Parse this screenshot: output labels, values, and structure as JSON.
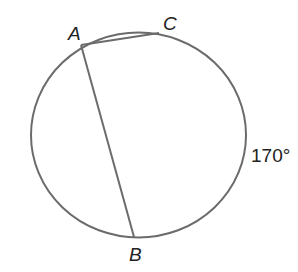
{
  "diagram": {
    "type": "circle-with-chords",
    "points": {
      "A": {
        "label": "A",
        "x": 81,
        "y": 45
      },
      "B": {
        "label": "B",
        "x": 134,
        "y": 240
      },
      "C": {
        "label": "C",
        "x": 159,
        "y": 33
      }
    },
    "chords": [
      {
        "from": "A",
        "to": "C"
      },
      {
        "from": "A",
        "to": "B"
      }
    ],
    "arc_label": "170°",
    "colors": {
      "stroke": "#6b6b6b",
      "text": "#222222"
    }
  }
}
